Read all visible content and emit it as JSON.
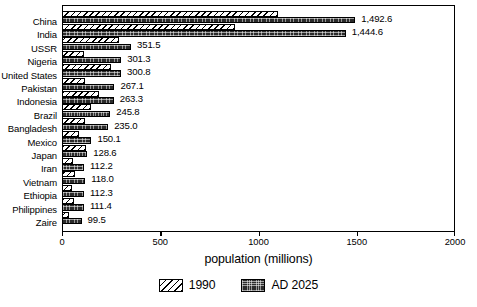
{
  "chart_data": {
    "type": "bar",
    "orientation": "horizontal",
    "title": "",
    "xlabel": "population (millions)",
    "ylabel": "",
    "xlim": [
      0,
      2000
    ],
    "xticks": [
      0,
      500,
      1000,
      1500,
      2000
    ],
    "xtick_labels": [
      "0",
      "500",
      "1000",
      "1500",
      "2000"
    ],
    "grid": false,
    "frame": true,
    "legend_position": "bottom-center",
    "categories": [
      "China",
      "India",
      "USSR",
      "Nigeria",
      "United States",
      "Pakistan",
      "Indonesia",
      "Brazil",
      "Bangladesh",
      "Mexico",
      "Japan",
      "Iran",
      "Vietnam",
      "Ethiopia",
      "Philippines",
      "Zaire"
    ],
    "series": [
      {
        "name": "1990",
        "fill": "diagonal-hatch",
        "values": [
          1100,
          880,
          290,
          110,
          250,
          115,
          190,
          150,
          115,
          88,
          124,
          56,
          67,
          50,
          62,
          36
        ]
      },
      {
        "name": "AD 2025",
        "fill": "dark-stipple",
        "values": [
          1492.6,
          1444.6,
          351.5,
          301.3,
          300.8,
          267.1,
          263.3,
          245.8,
          235.0,
          150.1,
          128.6,
          112.2,
          118.0,
          112.3,
          111.4,
          99.5
        ]
      }
    ],
    "data_labels": [
      "1,492.6",
      "1,444.6",
      "351.5",
      "301.3",
      "300.8",
      "267.1",
      "263.3",
      "245.8",
      "235.0",
      "150.1",
      "128.6",
      "112.2",
      "118.0",
      "112.3",
      "111.4",
      "99.5"
    ],
    "legend": [
      {
        "label": "1990"
      },
      {
        "label": "AD 2025"
      }
    ],
    "colors": {
      "series_1990": "#ffffff",
      "series_2025": "#2b2b2b",
      "axis": "#000000",
      "text": "#000000",
      "background": "#ffffff"
    }
  }
}
